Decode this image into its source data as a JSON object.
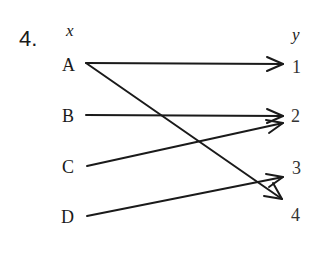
{
  "problem_number": "4.",
  "domain_label": "x",
  "range_label": "y",
  "domain": [
    "A",
    "B",
    "C",
    "D"
  ],
  "range": [
    "1",
    "2",
    "3",
    "4"
  ],
  "mappings": [
    {
      "from": "A",
      "to": "1"
    },
    {
      "from": "A",
      "to": "4"
    },
    {
      "from": "B",
      "to": "2"
    },
    {
      "from": "C",
      "to": "2"
    },
    {
      "from": "D",
      "to": "3"
    }
  ],
  "colors": {
    "ink": "#1a1a1a"
  }
}
